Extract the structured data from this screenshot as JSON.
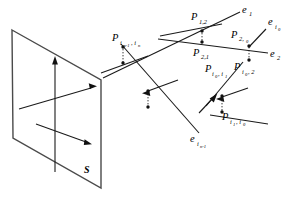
{
  "figure": {
    "background_color": "#ffffff",
    "line_color": "#1a1a1a",
    "plane_color": "#4a4a4a"
  },
  "plane": {
    "name": "S",
    "label": "S",
    "corners": "top-left (12,30), top-right (101,80), bottom-right (101,188), bottom-left (13,138)",
    "axes": [
      {
        "name": "vertical-axis",
        "direction": "up"
      },
      {
        "name": "horizontal-axis",
        "direction": "up-right"
      },
      {
        "name": "depth-axis",
        "direction": "down-right"
      }
    ]
  },
  "points": [
    {
      "name": "p-in1-in",
      "base": "P",
      "sub": "i",
      "sub2": "n-1",
      "sub3": "i",
      "sub4": "n",
      "display": "P i_{n-1}, i_n"
    },
    {
      "name": "p-1-2",
      "base": "P",
      "sub": "1,2",
      "display": "P 1,2"
    },
    {
      "name": "p-2-1",
      "base": "P",
      "sub": "2,1",
      "display": "P 2,1"
    },
    {
      "name": "p-2-i0",
      "base": "P",
      "sub": "2, i",
      "sub2": "0",
      "display": "P 2,i_0"
    },
    {
      "name": "p-i0-i1",
      "base": "P",
      "sub": "i",
      "sub2": "0",
      "sub3": ", i",
      "sub4": "1",
      "display": "P i_0, i_1"
    },
    {
      "name": "p-i0-2",
      "base": "P",
      "sub": "i",
      "sub2": "0",
      "sub3": ", 2",
      "display": "P i_0, 2"
    },
    {
      "name": "p-i1-i0",
      "base": "P",
      "sub": "i",
      "sub2": "1",
      "sub3": ", i",
      "sub4": "0",
      "display": "P i_1, i_0"
    }
  ],
  "rays": [
    {
      "name": "ray-e1",
      "base": "e",
      "sub": "1",
      "display": "e_1"
    },
    {
      "name": "ray-e2",
      "base": "e",
      "sub": "2",
      "display": "e_2"
    },
    {
      "name": "ray-ei0",
      "base": "e",
      "sub": "i",
      "sub2": "0",
      "display": "e_{i_0}"
    },
    {
      "name": "ray-ein1",
      "base": "e",
      "sub": "i",
      "sub2": "n-1",
      "display": "e_{i_{n-1}}"
    }
  ],
  "labels": {
    "P": "P",
    "e": "e",
    "S": "S",
    "one": "1",
    "two": "2",
    "one_two": "1,2",
    "two_one": "2,1",
    "two_comma_i": "2,",
    "i": "i",
    "zero": "0",
    "n": "n",
    "n_minus_1": "n-1",
    "comma_i": ", i",
    "comma_two": ", 2",
    "comma": ","
  }
}
